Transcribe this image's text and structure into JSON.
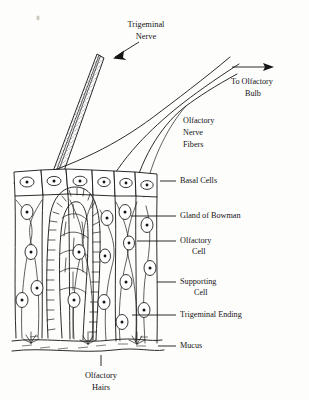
{
  "figure": {
    "ink_color": "#141414",
    "background_color": "#fdfdfc",
    "stipple_color": "#6e6e6e"
  },
  "top_labels": {
    "trigeminal_nerve": {
      "line1": "Trigeminal",
      "line2": "Nerve",
      "icon": "arrow-down-left-icon"
    },
    "to_olfactory_bulb": {
      "line1": "To  Olfactory",
      "line2": "Bulb",
      "icon": "arrow-right-icon"
    },
    "olfactory_nerve_fibers": {
      "line1": "Olfactory",
      "line2": "Nerve",
      "line3": "Fibers"
    }
  },
  "right_labels": [
    {
      "id": "basal-cells",
      "text": "Basal Cells",
      "text2": ""
    },
    {
      "id": "gland-of-bowman",
      "text": "Gland of Bowman",
      "text2": ""
    },
    {
      "id": "olfactory-cell",
      "text": "Olfactory",
      "text2": "Cell"
    },
    {
      "id": "supporting-cell",
      "text": "Supporting",
      "text2": "Cell"
    },
    {
      "id": "trigeminal-ending",
      "text": "Trigeminal Ending",
      "text2": ""
    },
    {
      "id": "mucus",
      "text": "Mucus",
      "text2": ""
    }
  ],
  "bottom_label": {
    "line1": "Olfactory",
    "line2": "Hairs"
  }
}
